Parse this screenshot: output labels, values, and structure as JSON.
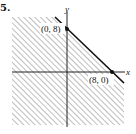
{
  "problem": {
    "number": "5."
  },
  "graph": {
    "x_axis_label": "x",
    "y_axis_label": "y",
    "points": [
      {
        "label": "(0, 8)",
        "x": 0,
        "y": 8
      },
      {
        "label": "(8, 0)",
        "x": 8,
        "y": 0
      }
    ],
    "boundary": {
      "equation": "x + y = 8",
      "style": "solid"
    },
    "shaded_region": "x + y <= 8",
    "hatch_color": "#9a9a9a",
    "line_color": "#111111"
  }
}
